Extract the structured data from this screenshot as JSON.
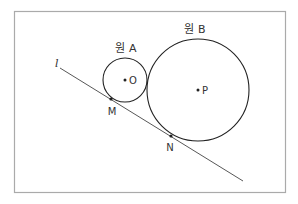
{
  "diagram": {
    "frame": {
      "x": 14,
      "y": 11,
      "width": 272,
      "height": 182,
      "stroke": "#aaaaaa"
    },
    "line_color": "#444444",
    "tangent_line": {
      "label": "l",
      "start": [
        60,
        68
      ],
      "end": [
        243,
        181
      ]
    },
    "circles": [
      {
        "name": "원 A",
        "label": "원 A",
        "center_label": "O",
        "cx": 125,
        "cy": 80,
        "r": 22,
        "label_pos": [
          126,
          52
        ]
      },
      {
        "name": "원 B",
        "label": "원 B",
        "center_label": "P",
        "cx": 198,
        "cy": 90,
        "r": 51,
        "label_pos": [
          195,
          33
        ]
      }
    ],
    "tangent_points": [
      {
        "label": "M",
        "x": 111,
        "y": 99,
        "label_pos": [
          112,
          115
        ]
      },
      {
        "label": "N",
        "x": 171,
        "y": 136,
        "label_pos": [
          170,
          151
        ]
      }
    ]
  }
}
